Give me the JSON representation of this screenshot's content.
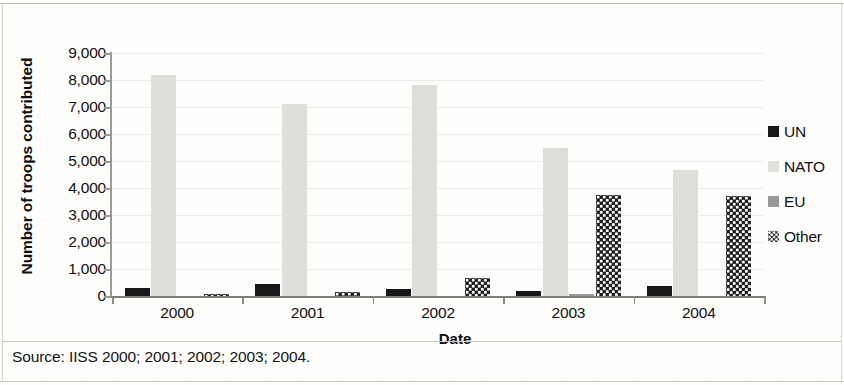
{
  "figure": {
    "source_note": "Source: IISS 2000; 2001; 2002; 2003; 2004."
  },
  "chart_data": {
    "type": "bar",
    "title": "",
    "xlabel": "Date",
    "ylabel": "Number of troops contributed",
    "categories": [
      "2000",
      "2001",
      "2002",
      "2003",
      "2004"
    ],
    "ylim": [
      0,
      9000
    ],
    "ytick_values": [
      0,
      1000,
      2000,
      3000,
      4000,
      5000,
      6000,
      7000,
      8000,
      9000
    ],
    "ytick_labels": [
      "0",
      "1,000",
      "2,000",
      "3,000",
      "4,000",
      "5,000",
      "6,000",
      "7,000",
      "8,000",
      "9,000"
    ],
    "grid": true,
    "legend_position": "right",
    "series": [
      {
        "name": "UN",
        "color": "#17171a",
        "pattern": "solid",
        "values": [
          280,
          450,
          250,
          200,
          380
        ]
      },
      {
        "name": "NATO",
        "color": "#dededa",
        "pattern": "solid",
        "values": [
          8200,
          7100,
          7800,
          5500,
          4650
        ]
      },
      {
        "name": "EU",
        "color": "#9a9a99",
        "pattern": "solid",
        "values": [
          0,
          0,
          0,
          70,
          0
        ]
      },
      {
        "name": "Other",
        "color": "#1b1b1e",
        "pattern": "dotted",
        "values": [
          30,
          150,
          650,
          3750,
          3720
        ]
      }
    ]
  }
}
